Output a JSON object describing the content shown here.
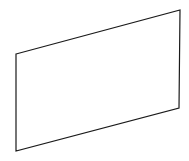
{
  "diagram": {
    "shape": "parallelogram",
    "stroke_color": "#1a1a1a",
    "fill_color": "none",
    "stroke_width": 1.2,
    "vertices": [
      {
        "name": "top-left",
        "x": 16,
        "y": 54
      },
      {
        "name": "top-right",
        "x": 180,
        "y": 10
      },
      {
        "name": "bottom-right",
        "x": 179,
        "y": 108
      },
      {
        "name": "bottom-left",
        "x": 16,
        "y": 151
      }
    ]
  }
}
